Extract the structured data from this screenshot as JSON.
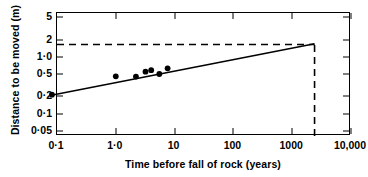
{
  "chart_data": {
    "type": "scatter",
    "title": "",
    "xlabel": "Time before fall of rock (years)",
    "ylabel": "Distance to be moved (m)",
    "xscale": "log",
    "yscale": "log",
    "xlim": [
      0.1,
      10000
    ],
    "ylim": [
      0.04,
      6.0
    ],
    "grid": false,
    "legend": "none",
    "xticks": [
      0.1,
      1.0,
      10,
      100,
      1000,
      10000
    ],
    "xtick_labels": [
      "0·1",
      "1·0",
      "10",
      "100",
      "1000",
      "10,000"
    ],
    "yticks": [
      5,
      2,
      1.0,
      0.5,
      0.2,
      0.1,
      0.05
    ],
    "ytick_labels": [
      "5",
      "2",
      "1·0",
      "0·5",
      "0·2",
      "0·1",
      "0·05"
    ],
    "points": [
      {
        "x": 0.082,
        "y": 0.215
      },
      {
        "x": 1.0,
        "y": 0.455
      },
      {
        "x": 2.2,
        "y": 0.45
      },
      {
        "x": 3.2,
        "y": 0.55
      },
      {
        "x": 4.0,
        "y": 0.585
      },
      {
        "x": 5.5,
        "y": 0.5
      },
      {
        "x": 7.6,
        "y": 0.63
      }
    ],
    "series": [
      {
        "name": "fitted regression line",
        "type": "line",
        "x": [
          0.08,
          2400
        ],
        "y": [
          0.21,
          1.72
        ]
      }
    ],
    "annotations": [
      {
        "name": "horizontal-reference-line",
        "type": "hline",
        "y": 1.66,
        "style": "dashed",
        "x_from": 0.1,
        "x_to": 2400
      },
      {
        "name": "vertical-reference-line",
        "type": "vline",
        "x": 2400,
        "style": "dashed",
        "y_from": 0.04,
        "y_to": 1.72
      }
    ]
  }
}
